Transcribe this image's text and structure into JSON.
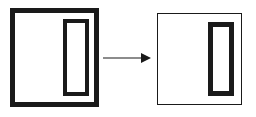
{
  "diagram": {
    "type": "before-after-transformation",
    "background_color": "#ffffff",
    "stroke_color": "#1a1a1a",
    "source": {
      "label": "thick-bordered square with thick-bordered vertical rectangle",
      "outer_shape": {
        "name": "square",
        "border_width_px": 5,
        "border_style": "solid",
        "fill": "#ffffff",
        "x": 10,
        "y": 8,
        "width": 89,
        "height": 99
      },
      "inner_shape": {
        "name": "vertical-rectangle",
        "border_width_px": 4,
        "border_style": "solid",
        "fill": "#ffffff",
        "x": 48,
        "y": 6,
        "width": 26,
        "height": 77
      }
    },
    "arrow": {
      "name": "rightwards-arrow",
      "direction": "right",
      "x1": 0,
      "y1": 8,
      "x2": 48,
      "y2": 8,
      "line_width_px": 1,
      "head": "filled-triangle"
    },
    "result": {
      "label": "thin-bordered square with thick-bordered vertical rectangle",
      "outer_shape": {
        "name": "square",
        "border_width_px": 1,
        "border_style": "solid",
        "fill": "#ffffff",
        "x": 157,
        "y": 13,
        "width": 85,
        "height": 92
      },
      "inner_shape": {
        "name": "vertical-rectangle",
        "border_width_px": 5,
        "border_style": "solid",
        "fill": "#ffffff",
        "x": 50,
        "y": 8,
        "width": 26,
        "height": 74
      }
    }
  }
}
